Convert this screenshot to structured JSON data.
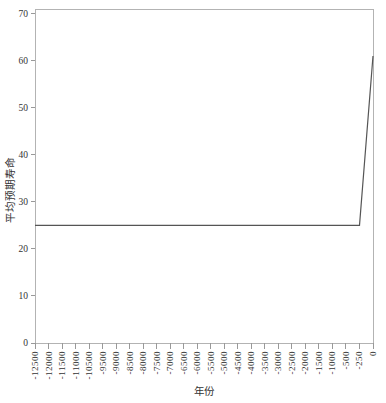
{
  "figure": {
    "width": 386,
    "height": 403
  },
  "chart_data": {
    "type": "line",
    "title": "",
    "xlabel": "年份",
    "ylabel": "平均预期寿命",
    "categories": [
      "-12500",
      "-12000",
      "-11500",
      "-11000",
      "-10500",
      "-9500",
      "-9000",
      "-8500",
      "-8000",
      "-7500",
      "-7000",
      "-6500",
      "-6000",
      "-5500",
      "-5000",
      "-4500",
      "-4000",
      "-3500",
      "-3000",
      "-2500",
      "-2000",
      "-1500",
      "-1000",
      "-500",
      "-250",
      "0"
    ],
    "series": [
      {
        "name": "平均预期寿命",
        "values": [
          25,
          25,
          25,
          25,
          25,
          25,
          25,
          25,
          25,
          25,
          25,
          25,
          25,
          25,
          25,
          25,
          25,
          25,
          25,
          25,
          25,
          25,
          25,
          25,
          25,
          61
        ]
      }
    ],
    "yticks": [
      0,
      10,
      20,
      30,
      40,
      50,
      60,
      70
    ],
    "ylim": [
      0,
      71
    ],
    "grid": false,
    "legend": "none",
    "colors": {
      "line": "#555555",
      "axis": "#b3b3b3",
      "tick": "#999999",
      "text": "#333333",
      "background": "#ffffff"
    }
  }
}
